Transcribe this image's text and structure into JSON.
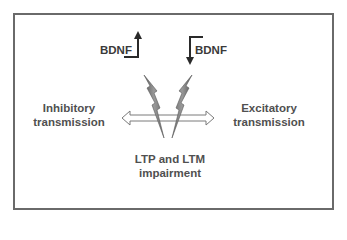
{
  "diagram": {
    "bdnf_left": {
      "label": "BDNF",
      "direction": "up"
    },
    "bdnf_right": {
      "label": "BDNF",
      "direction": "down"
    },
    "left_label": {
      "line1": "Inhibitory",
      "line2": "transmission"
    },
    "right_label": {
      "line1": "Excitatory",
      "line2": "transmission"
    },
    "bottom_label": {
      "line1": "LTP and LTM",
      "line2": "impairment"
    },
    "arrow": {
      "type": "double-headed",
      "orientation": "horizontal"
    },
    "bolts": {
      "count": 2,
      "color": "#7a7a7a"
    },
    "frame_color": "#6a6a6a",
    "text_color": "#505050"
  }
}
